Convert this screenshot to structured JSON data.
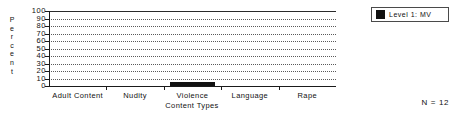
{
  "chart_data": {
    "type": "bar",
    "title": "",
    "subtitle": "",
    "xlabel": "Content Types",
    "ylabel": "Percent",
    "categories": [
      "Adult Content",
      "Nudity",
      "Violence",
      "Language",
      "Rape"
    ],
    "series": [
      {
        "name": "Level 1:  MV",
        "color": "#111111",
        "values": [
          0,
          0,
          5,
          0,
          0
        ]
      }
    ],
    "ylim": [
      0,
      100
    ],
    "yticks": [
      0,
      10,
      20,
      30,
      40,
      50,
      60,
      70,
      80,
      90,
      100
    ],
    "ytick_labels": [
      "0",
      "10",
      "20",
      "30",
      "40",
      "50",
      "60",
      "70",
      "80",
      "90",
      "100"
    ],
    "grid": true,
    "grid_axis": "y",
    "legend_position": "top-right",
    "annotations": [
      "N = 12"
    ]
  },
  "y_axis": {
    "title_letters": [
      "P",
      "e",
      "r",
      "c",
      "e",
      "n",
      "t"
    ]
  },
  "legend": {
    "entries": [
      {
        "label": "Level 1:  MV",
        "swatch_color": "#111111"
      }
    ]
  },
  "footnote": {
    "text": "N = 12"
  }
}
